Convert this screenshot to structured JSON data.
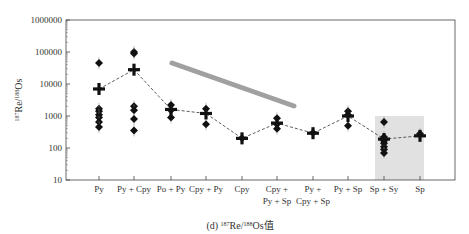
{
  "chart_data": {
    "type": "scatter",
    "title": "",
    "caption": "(d) ¹⁸⁷Re/¹⁸⁸Os值",
    "xlabel": "",
    "ylabel": "¹⁸⁷Re/¹⁸⁸Os",
    "yscale": "log",
    "ylim": [
      10,
      1000000
    ],
    "yticks": [
      "10",
      "100",
      "1000",
      "10000",
      "100000",
      "1000000"
    ],
    "categories": [
      [
        "Py"
      ],
      [
        "Py + Cpy"
      ],
      [
        "Po + Py"
      ],
      [
        "Cpy + Py"
      ],
      [
        "Cpy"
      ],
      [
        "Cpy +",
        "Py + Sp"
      ],
      [
        "Py +",
        "Cpy + Sp"
      ],
      [
        "Py + Sp"
      ],
      [
        "Sp + Sy"
      ],
      [
        "Sp"
      ]
    ],
    "series": [
      {
        "name": "samples",
        "marker": "diamond",
        "values": [
          [
            45000,
            1700,
            1400,
            1100,
            900,
            650,
            450
          ],
          [
            100000,
            90000,
            2000,
            1500,
            800,
            350
          ],
          [
            2200,
            1500,
            900
          ],
          [
            1700,
            550
          ],
          [
            200
          ],
          [
            850,
            550,
            400
          ],
          [
            300
          ],
          [
            1400,
            1100,
            500
          ],
          [
            650,
            220,
            170,
            140,
            110,
            90,
            70
          ],
          [
            280
          ]
        ]
      },
      {
        "name": "mean",
        "marker": "cross",
        "line": "dashed",
        "values": [
          7000,
          28000,
          1600,
          1200,
          200,
          600,
          290,
          1000,
          190,
          240
        ]
      }
    ],
    "annotations": [
      {
        "type": "arrow",
        "color": "#9a9a9a",
        "description": "decreasing trend arrow"
      },
      {
        "type": "shaded_region",
        "color": "#d9d9d9",
        "category": "Sp + Sy",
        "range": [
          10,
          1000
        ]
      }
    ],
    "grid": false,
    "legend": false
  }
}
